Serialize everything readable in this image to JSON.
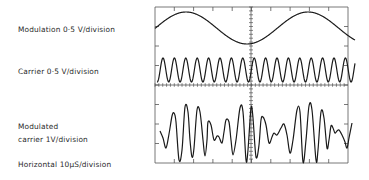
{
  "labels": {
    "modulation": "Modulation 0·5 V/division",
    "carrier": "Carrier 0·5 V/division",
    "modulated_line1": "Modulated",
    "modulated_line2": "carrier 1V/division",
    "horizontal": "Horizontal 10μS/division"
  },
  "scope": {
    "frame": {
      "left": 155,
      "top": 7,
      "right": 348,
      "bottom": 163
    },
    "h_divisions": 10,
    "v_divisions": 8,
    "center_x": 251,
    "center_y": 85,
    "line_color": "#1a1a1a",
    "grid_color": "#555555"
  },
  "traces": {
    "modulation": {
      "type": "sine",
      "x_start": 155,
      "x_end": 355,
      "center_y": 28,
      "amplitude": 16,
      "period": 122,
      "peak_x": 186
    },
    "carrier": {
      "type": "sine",
      "x_start": 157,
      "x_end": 355,
      "center_y": 70,
      "amplitude": 12,
      "period": 11.4,
      "peak_x": 163
    },
    "modulated_carrier": {
      "type": "polyline",
      "points": [
        [
          160,
          131
        ],
        [
          163,
          138
        ],
        [
          166,
          148
        ],
        [
          169,
          134
        ],
        [
          172,
          116
        ],
        [
          174,
          113
        ],
        [
          176,
          122
        ],
        [
          179,
          160
        ],
        [
          182,
          150
        ],
        [
          185,
          107
        ],
        [
          188,
          112
        ],
        [
          190,
          140
        ],
        [
          192,
          157
        ],
        [
          194,
          148
        ],
        [
          197,
          110
        ],
        [
          200,
          112
        ],
        [
          203,
          140
        ],
        [
          205,
          156
        ],
        [
          207,
          140
        ],
        [
          208,
          122
        ],
        [
          211,
          125
        ],
        [
          214,
          140
        ],
        [
          217,
          136
        ],
        [
          219,
          137
        ],
        [
          222,
          143
        ],
        [
          224,
          132
        ],
        [
          226,
          120
        ],
        [
          229,
          122
        ],
        [
          231,
          140
        ],
        [
          233,
          155
        ],
        [
          236,
          140
        ],
        [
          240,
          108
        ],
        [
          243,
          112
        ],
        [
          246,
          160
        ],
        [
          248,
          150
        ],
        [
          251,
          108
        ],
        [
          253,
          118
        ],
        [
          256,
          157
        ],
        [
          259,
          145
        ],
        [
          261,
          120
        ],
        [
          263,
          117
        ],
        [
          266,
          125
        ],
        [
          269,
          143
        ],
        [
          272,
          137
        ],
        [
          274,
          133
        ],
        [
          277,
          135
        ],
        [
          281,
          128
        ],
        [
          284,
          124
        ],
        [
          287,
          135
        ],
        [
          290,
          153
        ],
        [
          293,
          140
        ],
        [
          297,
          110
        ],
        [
          300,
          112
        ],
        [
          303,
          162
        ],
        [
          306,
          140
        ],
        [
          309,
          106
        ],
        [
          312,
          110
        ],
        [
          316,
          160
        ],
        [
          318,
          150
        ],
        [
          321,
          112
        ],
        [
          324,
          118
        ],
        [
          327,
          148
        ],
        [
          329,
          140
        ],
        [
          331,
          126
        ],
        [
          333,
          128
        ],
        [
          335,
          133
        ],
        [
          337,
          131
        ],
        [
          339,
          130
        ],
        [
          342,
          135
        ],
        [
          345,
          142
        ],
        [
          347,
          148
        ],
        [
          349,
          138
        ],
        [
          352,
          123
        ]
      ]
    }
  }
}
